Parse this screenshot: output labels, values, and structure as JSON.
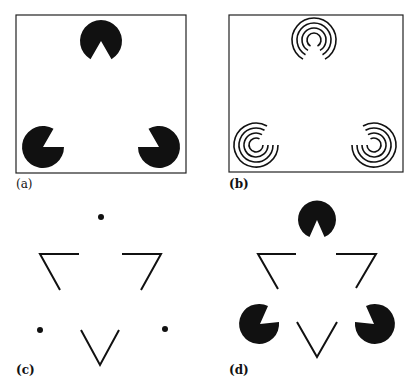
{
  "figure": {
    "panels": [
      {
        "id": "a",
        "label": "(a)",
        "description": "Three black pac-man inducers in a framed box"
      },
      {
        "id": "b",
        "label": "(b)",
        "description": "Three concentric-arc inducers in a framed box"
      },
      {
        "id": "c",
        "label": "(c)",
        "description": "Three dots with three line-corner fragments"
      },
      {
        "id": "d",
        "label": "(d)",
        "description": "Three pac-man inducers with three line-corner fragments"
      }
    ]
  },
  "colors": {
    "ink": "#111111",
    "background": "#ffffff"
  }
}
